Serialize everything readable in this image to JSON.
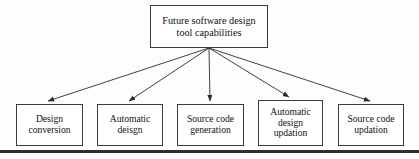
{
  "diagram": {
    "type": "tree",
    "orientation": "top-down",
    "root": {
      "id": "root",
      "label": "Future software design\ntool capabilities",
      "lines": [
        "Future software design",
        "tool capabilities"
      ]
    },
    "leaves": [
      {
        "id": "leaf-0",
        "label": "Design\nconversion",
        "lines": [
          "Design",
          "conversion"
        ]
      },
      {
        "id": "leaf-1",
        "label": "Automatic\ndeisgn",
        "lines": [
          "Automatic",
          "deisgn"
        ]
      },
      {
        "id": "leaf-2",
        "label": "Source code\ngeneration",
        "lines": [
          "Source code",
          "generation"
        ]
      },
      {
        "id": "leaf-3",
        "label": "Automatic\ndesign\nupdation",
        "lines": [
          "Automatic",
          "design",
          "updation"
        ]
      },
      {
        "id": "leaf-4",
        "label": "Source code\nupdation",
        "lines": [
          "Source code",
          "updation"
        ]
      }
    ],
    "edges": [
      {
        "from": "root",
        "to": "leaf-0",
        "style": "arrow"
      },
      {
        "from": "root",
        "to": "leaf-1",
        "style": "arrow"
      },
      {
        "from": "root",
        "to": "leaf-2",
        "style": "arrow"
      },
      {
        "from": "root",
        "to": "leaf-3",
        "style": "arrow"
      },
      {
        "from": "root",
        "to": "leaf-4",
        "style": "arrow"
      }
    ],
    "colors": {
      "background": "#fdfdfc",
      "box_fill": "#ffffff",
      "box_border": "#3b3b3b",
      "text": "#111111",
      "connector": "#2b2b2b",
      "rule": "#2e2e2e"
    }
  }
}
